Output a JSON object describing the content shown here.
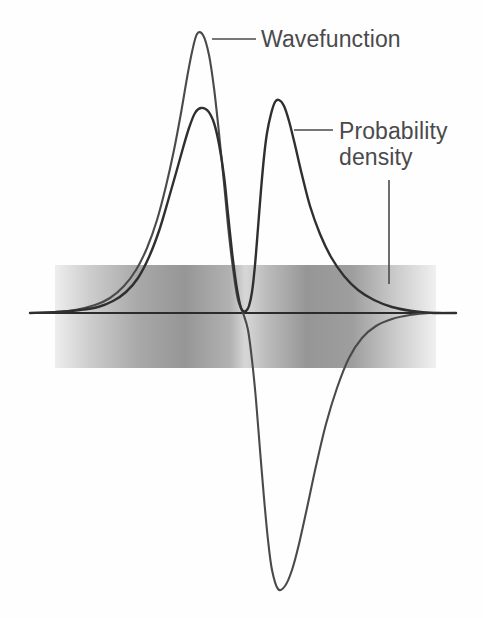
{
  "figure": {
    "background_color": "#fefefe",
    "curve_color": "#3a3a3c",
    "axis_color": "#2b2b2d",
    "label_color": "#4a4a4c",
    "band_color": "#8d8d8f"
  },
  "labels": {
    "wavefunction": "Wavefunction",
    "probability_density_line1": "Probability",
    "probability_density_line2": "density"
  },
  "chart_data": {
    "type": "line",
    "title": "",
    "xlabel": "",
    "ylabel": "",
    "grid": false,
    "legend": "annotations",
    "annotations": [
      {
        "text": "Wavefunction",
        "text_x": 261,
        "text_y": 48,
        "leader": {
          "x1": 212,
          "y1": 39,
          "x2": 256,
          "y2": 39
        },
        "target_curve": "wavefunction",
        "target_point": {
          "x": 197,
          "y": 33
        }
      },
      {
        "text": "Probability density",
        "text_x": 339,
        "text_y": 140,
        "leader": {
          "x1": 294,
          "y1": 130,
          "x2": 333,
          "y2": 130
        },
        "leader2": {
          "x1": 389,
          "y1": 180,
          "x2": 389,
          "y2": 284
        },
        "target_curve": "probability_density",
        "target_point": {
          "x": 277,
          "y": 100
        }
      }
    ],
    "axis": {
      "x_start": 30,
      "x_end": 456,
      "y": 313
    },
    "node_x": 243,
    "band": {
      "x_start": 55,
      "x_end": 436,
      "y_top": 265,
      "y_bottom": 368,
      "stops": [
        {
          "offset": 0.0,
          "gray": 238
        },
        {
          "offset": 0.09,
          "gray": 205
        },
        {
          "offset": 0.22,
          "gray": 168
        },
        {
          "offset": 0.34,
          "gray": 150
        },
        {
          "offset": 0.46,
          "gray": 178
        },
        {
          "offset": 0.5,
          "gray": 215
        },
        {
          "offset": 0.555,
          "gray": 188
        },
        {
          "offset": 0.66,
          "gray": 150
        },
        {
          "offset": 0.78,
          "gray": 158
        },
        {
          "offset": 0.9,
          "gray": 205
        },
        {
          "offset": 1.0,
          "gray": 240
        }
      ]
    },
    "series": [
      {
        "name": "wavefunction",
        "color": "#4a4a4c",
        "description": "2s-like radial wavefunction: large positive lobe peaking at x=197 y=33, crossing zero at node x=243, deep negative lobe with minimum at x=278 y=589, decaying tail to the right",
        "points": [
          [
            30,
            313
          ],
          [
            55,
            312
          ],
          [
            75,
            310
          ],
          [
            95,
            305
          ],
          [
            110,
            298
          ],
          [
            124,
            286
          ],
          [
            136,
            270
          ],
          [
            147,
            248
          ],
          [
            157,
            220
          ],
          [
            166,
            186
          ],
          [
            174,
            150
          ],
          [
            181,
            113
          ],
          [
            187,
            78
          ],
          [
            192,
            52
          ],
          [
            197,
            34
          ],
          [
            203,
            35
          ],
          [
            209,
            55
          ],
          [
            214,
            88
          ],
          [
            219,
            133
          ],
          [
            224,
            183
          ],
          [
            229,
            235
          ],
          [
            234,
            276
          ],
          [
            238,
            300
          ],
          [
            243,
            313
          ],
          [
            248,
            330
          ],
          [
            252,
            360
          ],
          [
            256,
            400
          ],
          [
            260,
            450
          ],
          [
            264,
            498
          ],
          [
            268,
            540
          ],
          [
            272,
            570
          ],
          [
            278,
            589
          ],
          [
            285,
            586
          ],
          [
            292,
            570
          ],
          [
            299,
            544
          ],
          [
            307,
            508
          ],
          [
            316,
            466
          ],
          [
            326,
            424
          ],
          [
            337,
            388
          ],
          [
            349,
            358
          ],
          [
            362,
            338
          ],
          [
            376,
            326
          ],
          [
            392,
            319
          ],
          [
            410,
            315
          ],
          [
            430,
            313
          ],
          [
            456,
            313
          ]
        ]
      },
      {
        "name": "probability_density",
        "color": "#2f2f31",
        "description": "Square of the wavefunction: two positive lobes, taller left lobe peaking at x=200 y=108 and right lobe peaking at x=277 y=100, touching zero at node x=243, long decaying tail to the right",
        "points": [
          [
            30,
            313
          ],
          [
            58,
            312
          ],
          [
            80,
            310
          ],
          [
            98,
            307
          ],
          [
            113,
            301
          ],
          [
            126,
            292
          ],
          [
            138,
            278
          ],
          [
            149,
            257
          ],
          [
            159,
            231
          ],
          [
            168,
            201
          ],
          [
            176,
            173
          ],
          [
            183,
            148
          ],
          [
            189,
            128
          ],
          [
            195,
            113
          ],
          [
            201,
            108
          ],
          [
            208,
            111
          ],
          [
            214,
            123
          ],
          [
            219,
            144
          ],
          [
            224,
            176
          ],
          [
            228,
            214
          ],
          [
            232,
            252
          ],
          [
            236,
            283
          ],
          [
            239,
            300
          ],
          [
            241,
            308
          ],
          [
            243,
            311
          ],
          [
            246,
            311
          ],
          [
            249,
            306
          ],
          [
            252,
            292
          ],
          [
            255,
            265
          ],
          [
            258,
            228
          ],
          [
            261,
            190
          ],
          [
            264,
            157
          ],
          [
            267,
            133
          ],
          [
            271,
            114
          ],
          [
            275,
            102
          ],
          [
            279,
            100
          ],
          [
            284,
            106
          ],
          [
            289,
            121
          ],
          [
            295,
            145
          ],
          [
            302,
            175
          ],
          [
            310,
            206
          ],
          [
            320,
            234
          ],
          [
            331,
            257
          ],
          [
            344,
            276
          ],
          [
            358,
            290
          ],
          [
            374,
            300
          ],
          [
            392,
            307
          ],
          [
            412,
            311
          ],
          [
            434,
            313
          ],
          [
            456,
            313
          ]
        ]
      }
    ]
  }
}
